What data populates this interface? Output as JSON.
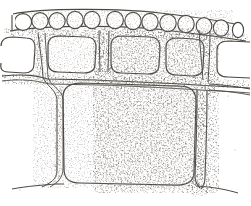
{
  "figure": {
    "title": "Cellular tissue cross-section, vintage engraving",
    "style": "line engraving with stipple shading",
    "background_color": "#ffffff",
    "ink_color": "#4a4742",
    "stipple_color": "#3a3630",
    "width": 251,
    "height": 206
  },
  "structure": {
    "rows": [
      {
        "name": "epidermal-row",
        "description": "Upper row of small rounded oval cells",
        "cell_count": 13,
        "cell_shape": "oval",
        "y_top": 11,
        "y_bottom": 32
      },
      {
        "name": "sub-epidermal-row",
        "description": "Middle row of medium rounded-rectangle cells",
        "cell_count": 5,
        "cell_shape": "rounded-rectangle",
        "y_top": 36,
        "y_bottom": 76
      },
      {
        "name": "parenchyma-row",
        "description": "Lower single large rounded-rectangle cell",
        "cell_count": 1,
        "cell_shape": "rounded-rectangle",
        "y_top": 82,
        "y_bottom": 186
      }
    ],
    "junctions": [
      {
        "name": "junction-left-upper",
        "x": 39,
        "y": 78,
        "type": "tee"
      },
      {
        "name": "junction-mid-upper",
        "x": 103,
        "y": 74,
        "type": "cross"
      },
      {
        "name": "junction-right-upper",
        "x": 205,
        "y": 82,
        "type": "cross"
      },
      {
        "name": "junction-left-lower",
        "x": 56,
        "y": 184,
        "type": "tee"
      },
      {
        "name": "junction-right-lower",
        "x": 196,
        "y": 186,
        "type": "tee"
      }
    ]
  },
  "upper_cells": [
    {
      "cx": 23,
      "cy": 22,
      "rx": 9,
      "ry": 10
    },
    {
      "cx": 40,
      "cy": 21,
      "rx": 8,
      "ry": 10
    },
    {
      "cx": 57,
      "cy": 21,
      "rx": 8,
      "ry": 10
    },
    {
      "cx": 75,
      "cy": 20,
      "rx": 8,
      "ry": 10
    },
    {
      "cx": 92,
      "cy": 20,
      "rx": 8,
      "ry": 10
    },
    {
      "cx": 109,
      "cy": 20,
      "rx": 8,
      "ry": 10
    },
    {
      "cx": 126,
      "cy": 21,
      "rx": 8,
      "ry": 10
    },
    {
      "cx": 143,
      "cy": 22,
      "rx": 8,
      "ry": 10
    },
    {
      "cx": 160,
      "cy": 23,
      "rx": 8,
      "ry": 10
    },
    {
      "cx": 177,
      "cy": 24,
      "rx": 8,
      "ry": 10
    },
    {
      "cx": 194,
      "cy": 25,
      "rx": 8,
      "ry": 10
    },
    {
      "cx": 211,
      "cy": 26,
      "rx": 8,
      "ry": 10
    },
    {
      "cx": 231,
      "cy": 28,
      "rx": 6,
      "ry": 9
    }
  ],
  "middle_cells": [
    {
      "x": 2,
      "y": 37,
      "w": 32,
      "h": 36,
      "r": 9
    },
    {
      "x": 48,
      "y": 36,
      "w": 48,
      "h": 37,
      "r": 10
    },
    {
      "x": 110,
      "y": 36,
      "w": 50,
      "h": 38,
      "r": 10
    },
    {
      "x": 165,
      "y": 38,
      "w": 40,
      "h": 38,
      "r": 10
    },
    {
      "x": 216,
      "y": 41,
      "w": 34,
      "h": 36,
      "r": 9
    }
  ],
  "lower_cells": [
    {
      "x": 62,
      "y": 83,
      "w": 133,
      "h": 101,
      "r": 14
    }
  ]
}
